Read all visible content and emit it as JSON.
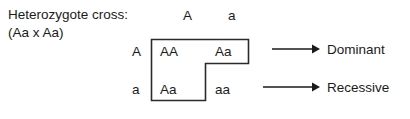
{
  "diagram": {
    "caption": {
      "line1": "Heterozygote cross:",
      "line2": "(Aa x Aa)"
    },
    "punnett": {
      "column_headers": [
        "A",
        "a"
      ],
      "row_headers": [
        "A",
        "a"
      ],
      "cells": [
        [
          "AA",
          "Aa"
        ],
        [
          "Aa",
          "aa"
        ]
      ]
    },
    "outcomes": [
      {
        "arrow": "right-arrow-icon",
        "label": "Dominant"
      },
      {
        "arrow": "right-arrow-icon",
        "label": "Recessive"
      }
    ],
    "colors": {
      "background": "#ffffff",
      "text": "#1a1a1a",
      "outline": "#2b2b2b"
    }
  }
}
